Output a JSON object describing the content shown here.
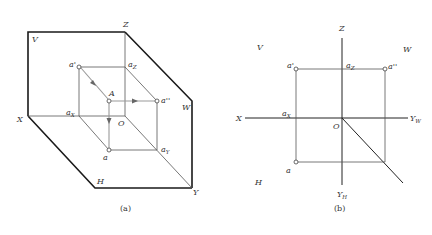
{
  "figure_a": {
    "caption": "(a)",
    "planes": {
      "v": "V",
      "w": "W",
      "h": "H"
    },
    "axes": {
      "x": "X",
      "y": "Y",
      "z": "Z",
      "origin": "O"
    },
    "point": "A",
    "projections": {
      "front": "a'",
      "side": "a''",
      "top": "a"
    },
    "axis_marks": {
      "ax": "a",
      "ax_sub": "X",
      "ay": "a",
      "ay_sub": "Y",
      "az": "a",
      "az_sub": "Z"
    }
  },
  "figure_b": {
    "caption": "(b)",
    "planes": {
      "v": "V",
      "w": "W",
      "h": "H"
    },
    "axes": {
      "x": "X",
      "z": "Z",
      "origin": "O",
      "yw": "Y",
      "yw_sub": "W",
      "yh": "Y",
      "yh_sub": "H"
    },
    "projections": {
      "front": "a'",
      "side": "a''",
      "top": "a"
    },
    "axis_marks": {
      "ax": "a",
      "ax_sub": "X",
      "az": "a",
      "az_sub": "Z"
    }
  }
}
